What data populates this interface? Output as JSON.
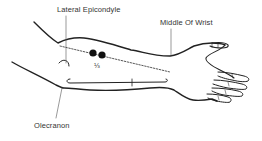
{
  "diagram": {
    "type": "anatomical-line-drawing",
    "labels": {
      "lateral_epicondyle": "Lateral Epicondyle",
      "middle_of_wrist": "Middle Of Wrist",
      "olecranon": "Olecranon",
      "fraction": "⅓"
    },
    "markers": {
      "dot_count": 2,
      "dot_color": "#111111",
      "reference_line_style": "dotted"
    },
    "colors": {
      "line": "#222222",
      "background": "#ffffff",
      "text": "#333333"
    }
  }
}
